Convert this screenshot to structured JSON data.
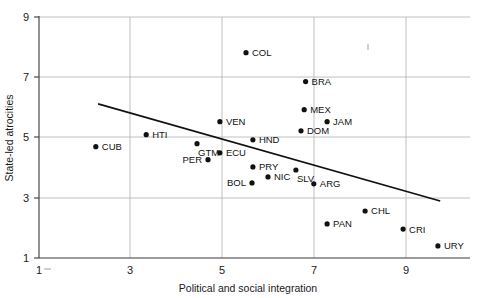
{
  "chart_data": {
    "type": "scatter",
    "title": "",
    "subtitle": "",
    "xlabel": "Political and social integration",
    "ylabel": "State-led atrocities",
    "xlim": [
      1,
      10.4
    ],
    "ylim": [
      1,
      9
    ],
    "xticks": [
      1,
      3,
      5,
      7,
      9
    ],
    "yticks": [
      1,
      3,
      5,
      7,
      9
    ],
    "xtick_labels": [
      "1",
      "3",
      "5",
      "7",
      "9"
    ],
    "ytick_labels": [
      "1",
      "3",
      "5",
      "7",
      "9"
    ],
    "grid": "major-gridlines-at-ticks",
    "legend": "none",
    "points": [
      {
        "label": "COL",
        "x": 5.52,
        "y": 7.81,
        "label_side": "right"
      },
      {
        "label": "BRA",
        "x": 6.82,
        "y": 6.85,
        "label_side": "right"
      },
      {
        "label": "MEX",
        "x": 6.79,
        "y": 5.92,
        "label_side": "right"
      },
      {
        "label": "JAM",
        "x": 7.29,
        "y": 5.52,
        "label_side": "right"
      },
      {
        "label": "DOM",
        "x": 6.72,
        "y": 5.22,
        "label_side": "right"
      },
      {
        "label": "VEN",
        "x": 4.95,
        "y": 5.52,
        "label_side": "right"
      },
      {
        "label": "HTI",
        "x": 3.34,
        "y": 5.09,
        "label_side": "right"
      },
      {
        "label": "HND",
        "x": 5.67,
        "y": 4.92,
        "label_side": "right"
      },
      {
        "label": "CUB",
        "x": 2.24,
        "y": 4.69,
        "label_side": "right"
      },
      {
        "label": "GTM",
        "x": 4.45,
        "y": 4.79,
        "label_side": "below-right"
      },
      {
        "label": "ECU",
        "x": 4.95,
        "y": 4.49,
        "label_side": "right"
      },
      {
        "label": "PER",
        "x": 4.69,
        "y": 4.26,
        "label_side": "left"
      },
      {
        "label": "PRY",
        "x": 5.67,
        "y": 4.02,
        "label_side": "right"
      },
      {
        "label": "SLV",
        "x": 6.61,
        "y": 3.92,
        "label_side": "below-right"
      },
      {
        "label": "NIC",
        "x": 6.0,
        "y": 3.69,
        "label_side": "right"
      },
      {
        "label": "BOL",
        "x": 5.65,
        "y": 3.49,
        "label_side": "left"
      },
      {
        "label": "ARG",
        "x": 7.0,
        "y": 3.46,
        "label_side": "right"
      },
      {
        "label": "CHL",
        "x": 8.12,
        "y": 2.56,
        "label_side": "right"
      },
      {
        "label": "PAN",
        "x": 7.29,
        "y": 2.13,
        "label_side": "right"
      },
      {
        "label": "CRI",
        "x": 8.95,
        "y": 1.96,
        "label_side": "right"
      },
      {
        "label": "URY",
        "x": 9.71,
        "y": 1.4,
        "label_side": "right"
      }
    ],
    "trendline": {
      "x_start": 2.29,
      "y_start": 6.11,
      "x_end": 9.76,
      "y_end": 2.89,
      "description": "negative-sloping fitted regression line"
    },
    "colors": {
      "point": "#111111",
      "trendline": "#111111",
      "gridline": "#b9b9b9",
      "axis": "#3a3a3a",
      "text": "#1a1a1a",
      "background": "#ffffff"
    }
  }
}
